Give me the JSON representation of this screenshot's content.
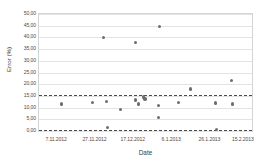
{
  "chart_data": {
    "type": "scatter",
    "title": "",
    "xlabel": "Date",
    "ylabel": "Error (%)",
    "ylim": [
      0,
      50
    ],
    "yticks": [
      "0,00",
      "5,00",
      "10,00",
      "15,00",
      "20,00",
      "25,00",
      "30,00",
      "35,00",
      "40,00",
      "45,00",
      "50,00"
    ],
    "ytick_values": [
      0,
      5,
      10,
      15,
      20,
      25,
      30,
      35,
      40,
      45,
      50
    ],
    "xticks": [
      "7.11.2012",
      "27.11.2012",
      "17.12.2012",
      "6.1.2013",
      "26.1.2013",
      "15.2.2013"
    ],
    "xtick_positions": [
      0.085,
      0.265,
      0.445,
      0.625,
      0.805,
      0.962
    ],
    "grid": true,
    "grid_axis": "y",
    "legend": "none",
    "marker_color": "#6d6d6d",
    "gridline_color": "#e3e3e3",
    "reference_line_color": "#4a4a4a",
    "reference_lines": [
      {
        "label": "upper limit",
        "value": 15.2,
        "style": "dashed"
      },
      {
        "label": "lower limit",
        "value": 0.35,
        "style": "dashed"
      }
    ],
    "points": [
      {
        "xfrac": 0.105,
        "y": 11.5
      },
      {
        "xfrac": 0.252,
        "y": 12.1
      },
      {
        "xfrac": 0.302,
        "y": 39.9
      },
      {
        "xfrac": 0.318,
        "y": 12.7
      },
      {
        "xfrac": 0.322,
        "y": 1.6
      },
      {
        "xfrac": 0.383,
        "y": 9.1
      },
      {
        "xfrac": 0.452,
        "y": 37.9
      },
      {
        "xfrac": 0.452,
        "y": 13.3
      },
      {
        "xfrac": 0.468,
        "y": 11.6
      },
      {
        "xfrac": 0.492,
        "y": 14.5
      },
      {
        "xfrac": 0.498,
        "y": 13.6
      },
      {
        "xfrac": 0.565,
        "y": 44.7
      },
      {
        "xfrac": 0.562,
        "y": 10.8
      },
      {
        "xfrac": 0.562,
        "y": 5.8
      },
      {
        "xfrac": 0.655,
        "y": 12.3
      },
      {
        "xfrac": 0.712,
        "y": 17.9
      },
      {
        "xfrac": 0.828,
        "y": 11.9
      },
      {
        "xfrac": 0.832,
        "y": 0.6
      },
      {
        "xfrac": 0.905,
        "y": 21.7
      },
      {
        "xfrac": 0.908,
        "y": 11.6
      }
    ]
  }
}
